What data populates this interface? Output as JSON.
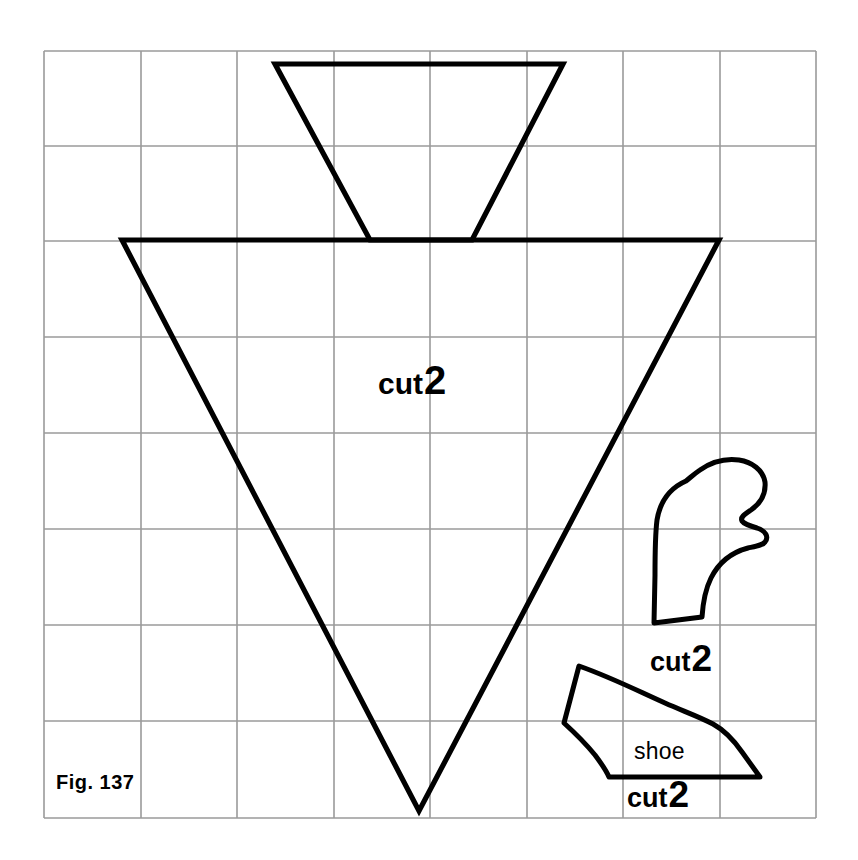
{
  "figure": {
    "caption": "Fig. 137",
    "background_color": "#ffffff",
    "grid_color": "#9a9a9a",
    "outline_color": "#000000"
  },
  "grid": {
    "columns": 8,
    "rows": 8,
    "left": 44,
    "top": 51,
    "right": 816,
    "bottom": 818,
    "cell_width": 96.5,
    "cell_height": 95.9
  },
  "pieces": [
    {
      "id": "body-top-trapezoid",
      "name": "bodice-top-piece",
      "label": "",
      "note": "upper trapezoid narrowing downward"
    },
    {
      "id": "body-main-triangle",
      "name": "body-triangle-piece",
      "label": "cut 2",
      "note": "large inverted triangle dress body"
    },
    {
      "id": "mitten",
      "name": "mitten-piece",
      "label": "cut 2",
      "note": "hand / mitten shape"
    },
    {
      "id": "shoe",
      "name": "shoe-piece",
      "label": "cut 2",
      "note": "shoe sole shape"
    }
  ],
  "labels": {
    "cut_word": "cut",
    "cut_number": "2",
    "body_cut": {
      "word": "cut",
      "number": "2"
    },
    "mitten_cut": {
      "word": "cut",
      "number": "2"
    },
    "shoe_name": "shoe",
    "shoe_cut": {
      "word": "cut",
      "number": "2"
    },
    "figure_caption": "Fig. 137"
  }
}
